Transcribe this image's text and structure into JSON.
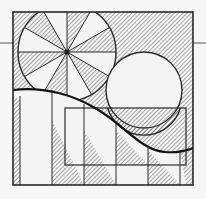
{
  "diagram": {
    "type": "geometric-hatched-composition",
    "colors": {
      "background": "#f7f7f7",
      "stroke": "#2a2a2a",
      "hatch": "#555555",
      "fill_light": "#f4f4f4"
    },
    "frame": {
      "x": 13,
      "y": 12,
      "w": 180,
      "h": 173
    },
    "horizon_line_y": 43,
    "wheel": {
      "cx": 67,
      "cy": 52,
      "r": 49,
      "spokes": 12
    },
    "circle": {
      "cx": 144,
      "cy": 90,
      "r": 38
    },
    "inner_rect": {
      "x": 65,
      "y": 108,
      "w": 121,
      "h": 57
    },
    "vertical_lines_x": [
      20,
      52,
      84,
      116,
      148,
      180
    ],
    "curve": "M13,90 C45,86 75,96 95,108 C125,125 140,150 165,152 C178,153 186,151 193,148"
  }
}
